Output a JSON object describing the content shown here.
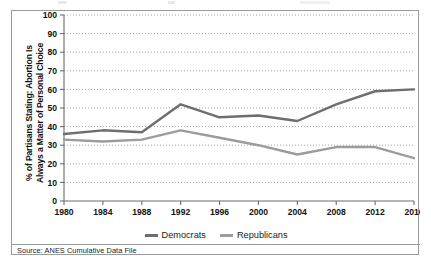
{
  "figure": {
    "source_note": "Source: ANES Cumulative Data File",
    "frame_color": "#9a9a9a",
    "background": "#ffffff"
  },
  "chart_data": {
    "type": "line",
    "title": "",
    "xlabel": "",
    "ylabel": "% of Partisans Stating: Abortion Is Always a Matter of Personal Choice",
    "ylabel_line1": "% of Partisans Stating: Abortion Is",
    "ylabel_line2": "Always a Matter of Personal Choice",
    "categories": [
      1980,
      1984,
      1988,
      1992,
      1996,
      2000,
      2004,
      2008,
      2012,
      2016
    ],
    "x_tick_labels": [
      "1980",
      "1984",
      "1988",
      "1992",
      "1996",
      "2000",
      "2004",
      "2008",
      "2012",
      "2016"
    ],
    "y_tick_labels": [
      "0",
      "10",
      "20",
      "30",
      "40",
      "50",
      "60",
      "70",
      "80",
      "90",
      "100"
    ],
    "ylim": [
      0,
      100
    ],
    "y_tick_step": 10,
    "xlim": [
      1980,
      2016
    ],
    "grid": "horizontal-dotted",
    "legend_position": "bottom-center",
    "series": [
      {
        "name": "Democrats",
        "color": "#6e6e6e",
        "values": [
          36,
          38,
          37,
          52,
          45,
          46,
          43,
          52,
          59,
          60
        ]
      },
      {
        "name": "Republicans",
        "color": "#9c9c9c",
        "values": [
          33,
          32,
          33,
          38,
          34,
          30,
          25,
          29,
          29,
          23
        ]
      }
    ]
  }
}
